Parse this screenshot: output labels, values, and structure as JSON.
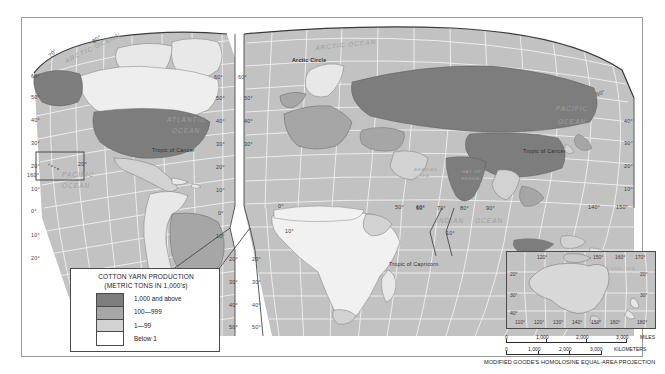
{
  "map": {
    "title": "World Cotton Yarn Production",
    "projection_note": "MODIFIED GOODE'S HOMOLOSINE EQUAL-AREA PROJECTION",
    "legend": {
      "title_line1": "COTTON YARN PRODUCTION",
      "title_line2": "(METRIC TONS IN 1,000's)",
      "classes": [
        {
          "label": "1,000 and above",
          "color": "#7d7d7d"
        },
        {
          "label": "100—999",
          "color": "#a6a6a6"
        },
        {
          "label": "1—99",
          "color": "#d2d2d2"
        },
        {
          "label": "Below 1",
          "color": "#ffffff"
        }
      ]
    },
    "ocean_labels": [
      {
        "text": "ARCTIC OCEAN",
        "x": 62,
        "y": 44,
        "rot": -26
      },
      {
        "text": "ARCTIC OCEAN",
        "x": 315,
        "y": 41,
        "rot": -6
      },
      {
        "text": "ATLANTIC",
        "x": 167,
        "y": 116,
        "rot": 0
      },
      {
        "text": "OCEAN",
        "x": 172,
        "y": 127,
        "rot": 0
      },
      {
        "text": "PACIFIC",
        "x": 556,
        "y": 105,
        "rot": 0
      },
      {
        "text": "OCEAN",
        "x": 558,
        "y": 118,
        "rot": 0
      },
      {
        "text": "PACIFIC",
        "x": 62,
        "y": 171,
        "rot": 0
      },
      {
        "text": "OCEAN",
        "x": 62,
        "y": 182,
        "rot": 0
      },
      {
        "text": "INDIAN",
        "x": 436,
        "y": 217,
        "rot": 0
      },
      {
        "text": "OCEAN",
        "x": 475,
        "y": 217,
        "rot": 0
      }
    ],
    "sea_labels": [
      {
        "text": "ARABIAN",
        "x": 414,
        "y": 167
      },
      {
        "text": "SEA",
        "x": 419,
        "y": 173
      },
      {
        "text": "BAY OF",
        "x": 462,
        "y": 169
      },
      {
        "text": "BENGAL",
        "x": 461,
        "y": 176
      }
    ],
    "line_labels": [
      {
        "text": "Arctic Circle",
        "x": 292,
        "y": 57,
        "kind": "arctic"
      },
      {
        "text": "Tropic of Cancer",
        "x": 152,
        "y": 147,
        "kind": "tropic"
      },
      {
        "text": "Tropic of Cancer",
        "x": 523,
        "y": 148,
        "kind": "tropic"
      },
      {
        "text": "Tropic of Capricorn",
        "x": 389,
        "y": 261,
        "kind": "tropic"
      }
    ],
    "graticule_labels": [
      {
        "text": "80°",
        "x": 92,
        "y": 36,
        "kind": "arc-num",
        "rot": -32
      },
      {
        "text": "70°",
        "x": 48,
        "y": 50,
        "kind": "arc-num",
        "rot": -44
      },
      {
        "text": "60°",
        "x": 31,
        "y": 73,
        "kind": "grat-num"
      },
      {
        "text": "50°",
        "x": 31,
        "y": 94,
        "kind": "grat-num"
      },
      {
        "text": "40°",
        "x": 31,
        "y": 117,
        "kind": "grat-num"
      },
      {
        "text": "30°",
        "x": 31,
        "y": 140,
        "kind": "grat-num"
      },
      {
        "text": "20°",
        "x": 31,
        "y": 163,
        "kind": "grat-num"
      },
      {
        "text": "10°",
        "x": 31,
        "y": 186,
        "kind": "grat-num"
      },
      {
        "text": "0°",
        "x": 31,
        "y": 208,
        "kind": "grat-num"
      },
      {
        "text": "10°",
        "x": 31,
        "y": 232,
        "kind": "grat-num"
      },
      {
        "text": "20°",
        "x": 31,
        "y": 255,
        "kind": "grat-num"
      },
      {
        "text": "160°",
        "x": 27,
        "y": 172,
        "kind": "grat-num"
      },
      {
        "text": "20°",
        "x": 78,
        "y": 161,
        "kind": "grat-num"
      },
      {
        "text": "60°",
        "x": 214,
        "y": 74,
        "kind": "grat-num"
      },
      {
        "text": "50°",
        "x": 216,
        "y": 95,
        "kind": "grat-num"
      },
      {
        "text": "40°",
        "x": 216,
        "y": 118,
        "kind": "grat-num"
      },
      {
        "text": "30°",
        "x": 216,
        "y": 141,
        "kind": "grat-num"
      },
      {
        "text": "20°",
        "x": 216,
        "y": 164,
        "kind": "grat-num"
      },
      {
        "text": "10°",
        "x": 216,
        "y": 187,
        "kind": "grat-num"
      },
      {
        "text": "0°",
        "x": 218,
        "y": 210,
        "kind": "grat-num"
      },
      {
        "text": "10°",
        "x": 216,
        "y": 233,
        "kind": "grat-num"
      },
      {
        "text": "20°",
        "x": 229,
        "y": 256,
        "kind": "grat-num"
      },
      {
        "text": "30°",
        "x": 229,
        "y": 279,
        "kind": "grat-num"
      },
      {
        "text": "40°",
        "x": 229,
        "y": 302,
        "kind": "grat-num"
      },
      {
        "text": "50°",
        "x": 229,
        "y": 324,
        "kind": "grat-num"
      },
      {
        "text": "60°",
        "x": 238,
        "y": 74,
        "kind": "grat-num"
      },
      {
        "text": "50°",
        "x": 244,
        "y": 95,
        "kind": "grat-num"
      },
      {
        "text": "40°",
        "x": 244,
        "y": 118,
        "kind": "grat-num"
      },
      {
        "text": "30°",
        "x": 244,
        "y": 141,
        "kind": "grat-num"
      },
      {
        "text": "20°",
        "x": 252,
        "y": 256,
        "kind": "grat-num"
      },
      {
        "text": "30°",
        "x": 252,
        "y": 279,
        "kind": "grat-num"
      },
      {
        "text": "40°",
        "x": 252,
        "y": 302,
        "kind": "grat-num"
      },
      {
        "text": "50°",
        "x": 252,
        "y": 324,
        "kind": "grat-num"
      },
      {
        "text": "0°",
        "x": 278,
        "y": 203,
        "kind": "grat-num"
      },
      {
        "text": "10°",
        "x": 285,
        "y": 228,
        "kind": "grat-num"
      },
      {
        "text": "50°",
        "x": 395,
        "y": 204,
        "kind": "grat-num"
      },
      {
        "text": "60°",
        "x": 416,
        "y": 204,
        "kind": "grat-num"
      },
      {
        "text": "60°",
        "x": 416,
        "y": 205,
        "kind": "grat-num"
      },
      {
        "text": "70°",
        "x": 437,
        "y": 205,
        "kind": "grat-num"
      },
      {
        "text": "80°",
        "x": 460,
        "y": 205,
        "kind": "grat-num"
      },
      {
        "text": "90°",
        "x": 486,
        "y": 205,
        "kind": "grat-num"
      },
      {
        "text": "10°",
        "x": 446,
        "y": 230,
        "kind": "grat-num"
      },
      {
        "text": "140°",
        "x": 588,
        "y": 204,
        "kind": "grat-num"
      },
      {
        "text": "150°",
        "x": 616,
        "y": 204,
        "kind": "grat-num"
      },
      {
        "text": "50°",
        "x": 596,
        "y": 90,
        "kind": "arc-num",
        "rot": -22
      },
      {
        "text": "40°",
        "x": 624,
        "y": 118,
        "kind": "grat-num"
      },
      {
        "text": "30°",
        "x": 624,
        "y": 140,
        "kind": "grat-num"
      },
      {
        "text": "20°",
        "x": 624,
        "y": 163,
        "kind": "grat-num"
      },
      {
        "text": "10°",
        "x": 624,
        "y": 186,
        "kind": "grat-num"
      }
    ],
    "inset": {
      "name": "Australia",
      "sea_label": "CORAL SEA",
      "top_labels": [
        {
          "text": "120°",
          "x": 30
        },
        {
          "text": "150°",
          "x": 86
        },
        {
          "text": "160°",
          "x": 108
        },
        {
          "text": "170°",
          "x": 128
        }
      ],
      "bottom_labels": [
        {
          "text": "110°",
          "x": 8
        },
        {
          "text": "120°",
          "x": 27
        },
        {
          "text": "130°",
          "x": 46
        },
        {
          "text": "140°",
          "x": 65
        },
        {
          "text": "150°",
          "x": 84
        },
        {
          "text": "160°",
          "x": 103
        },
        {
          "text": "180°",
          "x": 130
        }
      ],
      "left_labels": [
        {
          "text": "20°",
          "y": 19
        },
        {
          "text": "30°",
          "y": 40
        },
        {
          "text": "40°",
          "y": 58
        }
      ],
      "right_labels": [
        {
          "text": "20°",
          "y": 19
        },
        {
          "text": "30°",
          "y": 40
        }
      ]
    },
    "scale": {
      "miles": {
        "unit": "MILES",
        "ticks": [
          "0",
          "1,000",
          "2,000",
          "3,000"
        ]
      },
      "kilometers": {
        "unit": "KILOMETERS",
        "ticks": [
          "0",
          "1,000",
          "2,000",
          "3,000"
        ]
      }
    }
  }
}
